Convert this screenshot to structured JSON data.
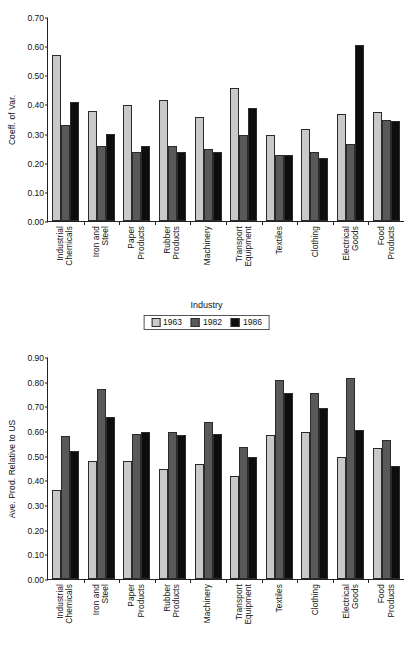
{
  "figure": {
    "series_names": [
      "1963",
      "1982",
      "1986"
    ],
    "series_colors": [
      "#c9c9c9",
      "#595959",
      "#0d0d0d"
    ],
    "categories": [
      [
        "Industrial",
        "Chemicals"
      ],
      [
        "Iron and",
        "Steel"
      ],
      [
        "Paper",
        "Products"
      ],
      [
        "Rubber",
        "Products"
      ],
      [
        "Machinery"
      ],
      [
        "Transport",
        "Equipment"
      ],
      [
        "Textiles"
      ],
      [
        "Clothing"
      ],
      [
        "Electrical",
        "Goods"
      ],
      [
        "Food",
        "Products"
      ]
    ]
  },
  "chart_data": [
    {
      "type": "bar",
      "title": "",
      "xlabel": "Industry",
      "ylabel": "Coeff. of Var.",
      "ylim": [
        0.0,
        0.7
      ],
      "ytick_step": 0.1,
      "ytick_labels": [
        "0.00",
        "0.10",
        "0.20",
        "0.30",
        "0.40",
        "0.50",
        "0.60",
        "0.70"
      ],
      "grid": false,
      "legend_position": "bottom",
      "categories": [
        "Industrial Chemicals",
        "Iron and Steel",
        "Paper Products",
        "Rubber Products",
        "Machinery",
        "Transport Equipment",
        "Textiles",
        "Clothing",
        "Electrical Goods",
        "Food Products"
      ],
      "series": [
        {
          "name": "1963",
          "values": [
            0.57,
            0.378,
            0.398,
            0.416,
            0.357,
            0.458,
            0.295,
            0.316,
            0.366,
            0.375
          ]
        },
        {
          "name": "1982",
          "values": [
            0.33,
            0.258,
            0.238,
            0.257,
            0.248,
            0.296,
            0.226,
            0.236,
            0.265,
            0.345
          ]
        },
        {
          "name": "1986",
          "values": [
            0.41,
            0.297,
            0.258,
            0.237,
            0.236,
            0.387,
            0.225,
            0.216,
            0.605,
            0.344
          ]
        }
      ]
    },
    {
      "type": "bar",
      "title": "",
      "xlabel": "Industry",
      "ylabel": "Ave. Prod. Relative to US",
      "ylim": [
        0.0,
        0.9
      ],
      "ytick_step": 0.1,
      "ytick_labels": [
        "0.00",
        "0.10",
        "0.20",
        "0.30",
        "0.40",
        "0.50",
        "0.60",
        "0.70",
        "0.80",
        "0.90"
      ],
      "grid": false,
      "legend_position": "bottom",
      "categories": [
        "Industrial Chemicals",
        "Iron and Steel",
        "Paper Products",
        "Rubber Products",
        "Machinery",
        "Transport Equipment",
        "Textiles",
        "Clothing",
        "Electrical Goods",
        "Food Products"
      ],
      "series": [
        {
          "name": "1963",
          "values": [
            0.36,
            0.48,
            0.478,
            0.447,
            0.465,
            0.416,
            0.584,
            0.595,
            0.494,
            0.533
          ]
        },
        {
          "name": "1982",
          "values": [
            0.58,
            0.77,
            0.588,
            0.596,
            0.636,
            0.536,
            0.805,
            0.755,
            0.815,
            0.563
          ]
        },
        {
          "name": "1986",
          "values": [
            0.52,
            0.657,
            0.597,
            0.585,
            0.586,
            0.494,
            0.755,
            0.694,
            0.603,
            0.46
          ]
        }
      ]
    }
  ]
}
